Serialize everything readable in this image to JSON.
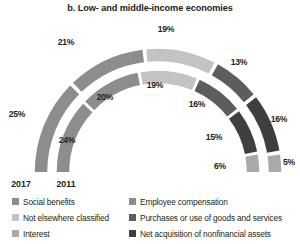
{
  "chart_data": {
    "type": "pie",
    "title": "b. Low- and middle-income economies",
    "subtitle": "",
    "xlabel": "",
    "ylabel": "",
    "shape": "semicircle-donut",
    "units": "percent",
    "legend_position": "bottom",
    "grid": false,
    "categories": [
      "Social benefits",
      "Employee compensation",
      "Not elsewhere classified",
      "Purchases or use of goods and services",
      "Interest",
      "Net acquisition of nonfinancial assets"
    ],
    "category_colors": [
      "#8d8d8d",
      "#8d8d8d",
      "#c3c3c3",
      "#5d5d5d",
      "#3f3f3f",
      "#a9a9a9"
    ],
    "series": [
      {
        "name": "2017",
        "ring": "outer",
        "values": [
          25,
          21,
          19,
          13,
          16,
          5
        ],
        "labels": [
          "25%",
          "21%",
          "19%",
          "13%",
          "16%",
          "5%"
        ]
      },
      {
        "name": "2011",
        "ring": "inner",
        "values": [
          24,
          20,
          19,
          16,
          15,
          6
        ],
        "labels": [
          "24%",
          "20%",
          "19%",
          "16%",
          "15%",
          "6%"
        ]
      }
    ]
  },
  "title": "b. Low- and middle-income economies",
  "ring_labels": {
    "outer": "2017",
    "inner": "2011"
  },
  "outer_labels": {
    "s0": "25%",
    "s1": "21%",
    "s2": "19%",
    "s3": "13%",
    "s4": "16%",
    "s5": "5%"
  },
  "inner_labels": {
    "s0": "24%",
    "s1": "20%",
    "s2": "19%",
    "s3": "16%",
    "s4": "15%",
    "s5": "6%"
  },
  "legend": {
    "left_column": [
      {
        "label": "Social benefits",
        "color": "#8d8d8d"
      },
      {
        "label": "Not elsewhere classified",
        "color": "#c3c3c3"
      },
      {
        "label": "Interest",
        "color": "#a9a9a9"
      }
    ],
    "right_column": [
      {
        "label": "Employee compensation",
        "color": "#8d8d8d"
      },
      {
        "label": "Purchases or use of goods and services",
        "color": "#5d5d5d"
      },
      {
        "label": "Net acquisition of nonfinancial assets",
        "color": "#3f3f3f"
      }
    ]
  }
}
